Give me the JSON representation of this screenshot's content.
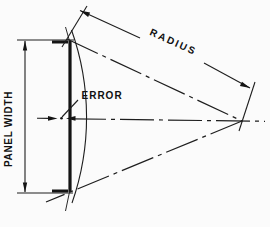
{
  "diagram": {
    "type": "engineering-dimension-diagram",
    "labels": {
      "panel_width": "PANEL WIDTH",
      "error": "ERROR",
      "radius": "RADIUS"
    },
    "colors": {
      "line": "#1e1e1e",
      "thick_line": "#141414",
      "background": "#fbfbfb"
    }
  }
}
